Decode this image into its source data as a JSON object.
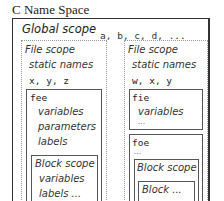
{
  "diagram": {
    "title": "C Name Space",
    "global": {
      "label": "Global scope",
      "names": "a, b, c, d, ..."
    },
    "file_left": {
      "label": "File scope",
      "static_label": "static names",
      "names": "x, y, z",
      "function": {
        "name": "fee",
        "items": [
          "variables",
          "parameters",
          "labels"
        ],
        "block": {
          "label": "Block scope",
          "items": [
            "variables",
            "labels ..."
          ]
        }
      }
    },
    "file_right": {
      "label": "File scope",
      "static_label": "static names",
      "names": "w, x, y",
      "function1": {
        "name": "fie",
        "items": [
          "variables",
          "..."
        ]
      },
      "function2": {
        "name": "foe",
        "items": [
          "..."
        ],
        "block": {
          "label": "Block scope",
          "inner": "Block ..."
        }
      }
    }
  }
}
